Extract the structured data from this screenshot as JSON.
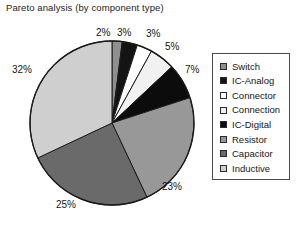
{
  "chart_data": {
    "type": "pie",
    "title": "Pareto analysis (by component type)",
    "xlabel": "",
    "ylabel": "",
    "legend_position": "right",
    "grid": false,
    "units": "%",
    "categories": [
      "Switch",
      "IC-Analog",
      "Connector",
      "Connection",
      "IC-Digital",
      "Resistor",
      "Capacitor",
      "Inductive"
    ],
    "values": [
      2,
      3,
      3,
      5,
      7,
      23,
      25,
      32
    ],
    "labels": [
      "2%",
      "3%",
      "3%",
      "5%",
      "7%",
      "23%",
      "25%",
      "32%"
    ],
    "colors": [
      "#8f8f8f",
      "#141414",
      "#ffffff",
      "#f1f1f1",
      "#0c0c0c",
      "#989898",
      "#6a6a6a",
      "#cfcfcf"
    ],
    "slices": [
      {
        "name": "Switch",
        "value": 2,
        "label": "2%",
        "color": "#8f8f8f"
      },
      {
        "name": "IC-Analog",
        "value": 3,
        "label": "3%",
        "color": "#141414"
      },
      {
        "name": "Connector",
        "value": 3,
        "label": "3%",
        "color": "#ffffff"
      },
      {
        "name": "Connection",
        "value": 5,
        "label": "5%",
        "color": "#f1f1f1"
      },
      {
        "name": "IC-Digital",
        "value": 7,
        "label": "7%",
        "color": "#0c0c0c"
      },
      {
        "name": "Resistor",
        "value": 23,
        "label": "23%",
        "color": "#989898"
      },
      {
        "name": "Capacitor",
        "value": 25,
        "label": "25%",
        "color": "#6a6a6a"
      },
      {
        "name": "Inductive",
        "value": 32,
        "label": "32%",
        "color": "#cfcfcf"
      }
    ]
  },
  "title": {
    "text": "Pareto analysis (by component type)"
  },
  "legend": {
    "items": [
      {
        "label": "Switch",
        "color": "#8f8f8f"
      },
      {
        "label": "IC-Analog",
        "color": "#141414"
      },
      {
        "label": "Connector",
        "color": "#ffffff"
      },
      {
        "label": "Connection",
        "color": "#f1f1f1"
      },
      {
        "label": "IC-Digital",
        "color": "#0c0c0c"
      },
      {
        "label": "Resistor",
        "color": "#989898"
      },
      {
        "label": "Capacitor",
        "color": "#6a6a6a"
      },
      {
        "label": "Inductive",
        "color": "#cfcfcf"
      }
    ]
  },
  "pie": {
    "center_x": 112,
    "center_y": 123,
    "radius": 82,
    "start_angle_deg": 0,
    "outline_color": "#1c1c1c"
  },
  "slice_label_positions": [
    {
      "label": "2%",
      "x": 96,
      "y": 27
    },
    {
      "label": "3%",
      "x": 117,
      "y": 27
    },
    {
      "label": "3%",
      "x": 146,
      "y": 28
    },
    {
      "label": "5%",
      "x": 165,
      "y": 41
    },
    {
      "label": "7%",
      "x": 185,
      "y": 64
    },
    {
      "label": "23%",
      "x": 162,
      "y": 181
    },
    {
      "label": "25%",
      "x": 56,
      "y": 199
    },
    {
      "label": "32%",
      "x": 12,
      "y": 64
    }
  ]
}
